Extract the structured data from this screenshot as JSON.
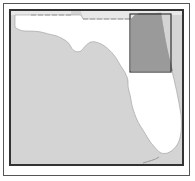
{
  "map": {
    "subject": "Florida locator map",
    "highlight_region": "Northeast Florida Atlantic coast (Jacksonville to St. Augustine / Daytona area)",
    "colors": {
      "water": "#d4d4d4",
      "land": "#ffffff",
      "neighboring_states": "#e6e6e6",
      "highlight_fill": "#9a9a9a",
      "highlight_border": "#333333",
      "frame": "#333333"
    }
  }
}
